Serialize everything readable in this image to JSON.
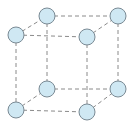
{
  "diagram": {
    "type": "simple-cubic-lattice",
    "atom_fill": "#cfe8f3",
    "atom_stroke": "#7a8a94",
    "edge_color": "#8a8a8a",
    "atoms": [
      {
        "id": "back-top-left",
        "cx": 47,
        "cy": 16
      },
      {
        "id": "back-top-right",
        "cx": 118,
        "cy": 16
      },
      {
        "id": "front-top-left",
        "cx": 16,
        "cy": 35
      },
      {
        "id": "front-top-right",
        "cx": 87,
        "cy": 37
      },
      {
        "id": "back-bottom-left",
        "cx": 47,
        "cy": 89
      },
      {
        "id": "back-bottom-right",
        "cx": 118,
        "cy": 89
      },
      {
        "id": "front-bottom-left",
        "cx": 16,
        "cy": 110
      },
      {
        "id": "front-bottom-right",
        "cx": 87,
        "cy": 112
      }
    ],
    "atom_radius": 8
  }
}
